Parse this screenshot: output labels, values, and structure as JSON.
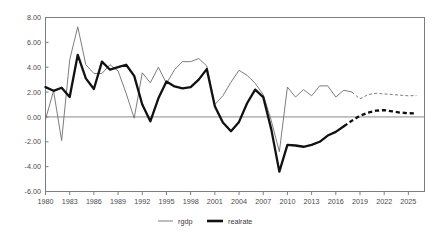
{
  "chart_data": {
    "type": "line",
    "title": "",
    "subtitle": "",
    "xlabel": "",
    "ylabel": "",
    "xlim": [
      1980,
      2027
    ],
    "ylim": [
      -6,
      8
    ],
    "grid": false,
    "legend_position": "bottom",
    "y_ticks": [
      8,
      6,
      4,
      2,
      0,
      -2,
      -4,
      -6
    ],
    "y_tick_labels": [
      "8.00",
      "6.00",
      "4.00",
      "2.00",
      "0.00",
      "-2.00",
      "-4.00",
      "-6.00"
    ],
    "x_ticks": [
      1980,
      1983,
      1986,
      1989,
      1992,
      1995,
      1998,
      2001,
      2004,
      2007,
      2010,
      2013,
      2016,
      2019,
      2022,
      2025
    ],
    "x_tick_labels": [
      "1980",
      "1983",
      "1986",
      "1989",
      "1992",
      "1995",
      "1998",
      "2001",
      "2004",
      "2007",
      "2010",
      "2013",
      "2016",
      "2019",
      "2022",
      "2025"
    ],
    "zero_line": 0,
    "series": [
      {
        "name": "rgdp",
        "color": "#6e6e6e",
        "style": "thin",
        "forecast_starts": 2018,
        "x": [
          1980,
          1981,
          1982,
          1983,
          1984,
          1985,
          1986,
          1987,
          1988,
          1989,
          1990,
          1991,
          1992,
          1993,
          1994,
          1995,
          1996,
          1997,
          1998,
          1999,
          2000,
          2001,
          2002,
          2003,
          2004,
          2005,
          2006,
          2007,
          2008,
          2009,
          2010,
          2011,
          2012,
          2013,
          2014,
          2015,
          2016,
          2017,
          2018,
          2019,
          2020,
          2021,
          2022,
          2023,
          2024,
          2025,
          2026
        ],
        "values": [
          -0.2,
          2.1,
          -1.9,
          4.6,
          7.25,
          4.2,
          3.5,
          3.5,
          4.2,
          3.7,
          1.9,
          -0.1,
          3.55,
          2.75,
          4.0,
          2.7,
          3.8,
          4.45,
          4.45,
          4.7,
          4.1,
          1.0,
          1.7,
          2.8,
          3.75,
          3.35,
          2.7,
          1.8,
          -0.3,
          -2.8,
          2.4,
          1.6,
          2.2,
          1.7,
          2.5,
          2.5,
          1.6,
          2.15,
          2.0,
          1.45,
          1.8,
          1.9,
          1.85,
          1.8,
          1.75,
          1.7,
          1.72
        ]
      },
      {
        "name": "realrate",
        "color": "#111111",
        "style": "thick",
        "forecast_starts": 2017,
        "x": [
          1980,
          1981,
          1982,
          1983,
          1984,
          1985,
          1986,
          1987,
          1988,
          1989,
          1990,
          1991,
          1992,
          1993,
          1994,
          1995,
          1996,
          1997,
          1998,
          1999,
          2000,
          2001,
          2002,
          2003,
          2004,
          2005,
          2006,
          2007,
          2008,
          2009,
          2010,
          2011,
          2012,
          2013,
          2014,
          2015,
          2016,
          2017,
          2018,
          2019,
          2020,
          2021,
          2022,
          2023,
          2024,
          2025,
          2026
        ],
        "values": [
          2.4,
          2.1,
          2.35,
          1.6,
          5.0,
          3.1,
          2.25,
          4.45,
          3.8,
          4.0,
          4.2,
          3.3,
          1.0,
          -0.35,
          1.5,
          2.85,
          2.45,
          2.3,
          2.4,
          3.0,
          3.85,
          0.85,
          -0.45,
          -1.15,
          -0.4,
          1.1,
          2.2,
          1.6,
          -1.0,
          -4.4,
          -2.25,
          -2.3,
          -2.4,
          -2.25,
          -2.0,
          -1.5,
          -1.2,
          -0.75,
          -0.3,
          0.1,
          0.35,
          0.5,
          0.55,
          0.45,
          0.35,
          0.3,
          0.28
        ]
      }
    ]
  },
  "legend": {
    "items": [
      {
        "label": "rgdp"
      },
      {
        "label": "realrate"
      }
    ]
  }
}
